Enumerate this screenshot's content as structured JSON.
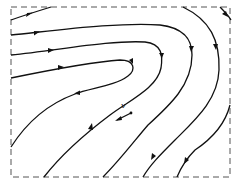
{
  "figure": {
    "type": "streamline field",
    "colors": {
      "lines": "#111111",
      "frame": "#555555",
      "background": "#ffffff"
    }
  },
  "vector_label": "v"
}
